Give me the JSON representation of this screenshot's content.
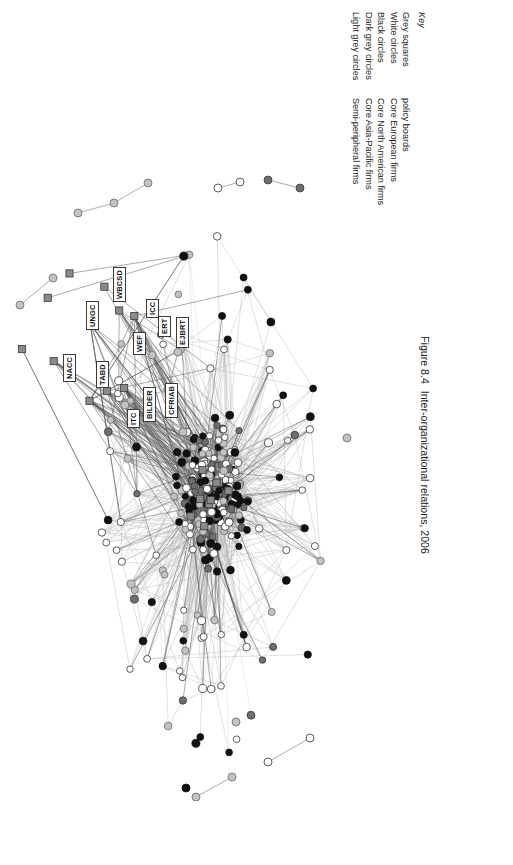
{
  "figure": {
    "caption_number": "Figure 8.4",
    "caption_text": "Inter-organizational relations, 2006"
  },
  "legend": {
    "title": "Key",
    "entries": [
      {
        "shape": "Grey squares",
        "meaning": "policy boards",
        "color": "#8a8a8a",
        "marker": "square"
      },
      {
        "shape": "White circles",
        "meaning": "Core European firms",
        "color": "#ffffff",
        "marker": "circle"
      },
      {
        "shape": "Black circles",
        "meaning": "Core North American firms",
        "color": "#111111",
        "marker": "circle"
      },
      {
        "shape": "Dark grey circles",
        "meaning": "Core Asia-Pacific firms",
        "color": "#6e6e6e",
        "marker": "circle"
      },
      {
        "shape": "Light grey circles",
        "meaning": "Semi-peripheral firms",
        "color": "#bcbcbc",
        "marker": "circle"
      }
    ]
  },
  "graph": {
    "title": "Inter-organizational relations network",
    "node_labels": [
      {
        "text": "NACC",
        "x": 183,
        "y": 352
      },
      {
        "text": "UNGC",
        "x": 206,
        "y": 300
      },
      {
        "text": "WBCSD",
        "x": 233,
        "y": 272
      },
      {
        "text": "TABD",
        "x": 216,
        "y": 358
      },
      {
        "text": "WEF",
        "x": 253,
        "y": 325
      },
      {
        "text": "ICC",
        "x": 266,
        "y": 288
      },
      {
        "text": "ERT",
        "x": 278,
        "y": 307
      },
      {
        "text": "EJBRT",
        "x": 296,
        "y": 318
      },
      {
        "text": "ITC",
        "x": 247,
        "y": 398
      },
      {
        "text": "BILDER",
        "x": 263,
        "y": 392
      },
      {
        "text": "CFRIAB",
        "x": 285,
        "y": 388
      }
    ],
    "edge_color_light": "#b3b3b3",
    "edge_color_dark": "#4d4d4d"
  }
}
